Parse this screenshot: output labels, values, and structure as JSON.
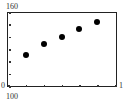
{
  "chart_data": {
    "type": "scatter",
    "title": "",
    "xlabel": "",
    "ylabel": "",
    "x": [
      1,
      2,
      3,
      4,
      5
    ],
    "values": [
      125,
      134,
      140,
      146,
      152
    ],
    "ylim": [
      100,
      160
    ],
    "xlim": [
      0,
      6
    ],
    "x_ticks": [
      0,
      1,
      2,
      3,
      4,
      5,
      6
    ],
    "y_ticks": [
      100,
      110,
      120,
      130,
      140,
      150,
      160
    ],
    "grid": false,
    "legend": null,
    "labels": {
      "y_max": "160",
      "y_min": "100",
      "x_min": "0",
      "x_max": "1"
    }
  }
}
